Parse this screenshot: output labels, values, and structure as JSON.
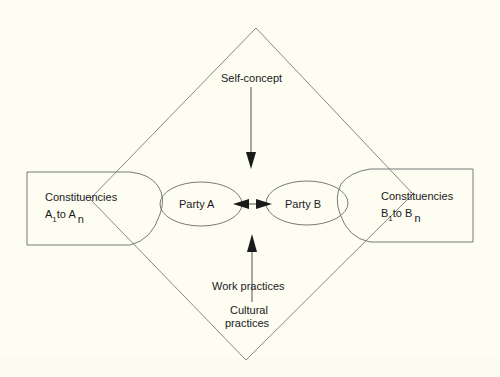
{
  "diagram": {
    "top_label": "Self-concept",
    "bottom_labels": {
      "work": "Work practices",
      "cultural_line1": "Cultural",
      "cultural_line2": "practices"
    },
    "party_a": {
      "label": "Party A"
    },
    "party_b": {
      "label": "Party B"
    },
    "constituencies_a": {
      "title": "Constituencies",
      "letter": "A",
      "sub_start": "1",
      "to": "to",
      "letter_end": "A",
      "sub_end": "n"
    },
    "constituencies_b": {
      "title": "Constituencies",
      "letter": "B",
      "sub_start": "1",
      "to": "to",
      "letter_end": "B",
      "sub_end": "n"
    },
    "colors": {
      "background": "#fdfdf2",
      "line": "#6b6b6b",
      "arrow": "#1a1a1a"
    }
  }
}
